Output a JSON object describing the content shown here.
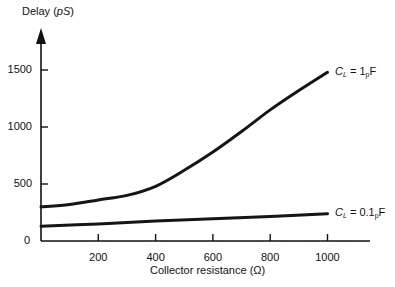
{
  "chart_data": {
    "type": "line",
    "title": "",
    "xlabel": "Collector resistance (Ω)",
    "ylabel": "Delay (pS)",
    "ylabel_parts": {
      "prefix": "Delay (",
      "unit": "pS",
      "suffix": ")"
    },
    "xlim": [
      0,
      1150
    ],
    "ylim": [
      0,
      1750
    ],
    "x_ticks": [
      200,
      400,
      600,
      800,
      1000
    ],
    "y_ticks": [
      0,
      500,
      1000,
      1500
    ],
    "grid": false,
    "legend": "inline annotations at curve ends",
    "series": [
      {
        "name": "CL = 1pF",
        "label_main": "C",
        "label_sub": "L",
        "label_eq": " = 1",
        "label_unit_sub": "p",
        "label_unit": "F",
        "x": [
          0,
          100,
          200,
          300,
          400,
          500,
          600,
          700,
          800,
          900,
          1000
        ],
        "values": [
          300,
          320,
          360,
          400,
          480,
          620,
          780,
          960,
          1150,
          1320,
          1480
        ]
      },
      {
        "name": "CL = 0.1pF",
        "label_main": "C",
        "label_sub": "L",
        "label_eq": " = 0.1",
        "label_unit_sub": "p",
        "label_unit": "F",
        "x": [
          0,
          200,
          400,
          600,
          800,
          1000
        ],
        "values": [
          130,
          150,
          175,
          195,
          215,
          240
        ]
      }
    ]
  }
}
